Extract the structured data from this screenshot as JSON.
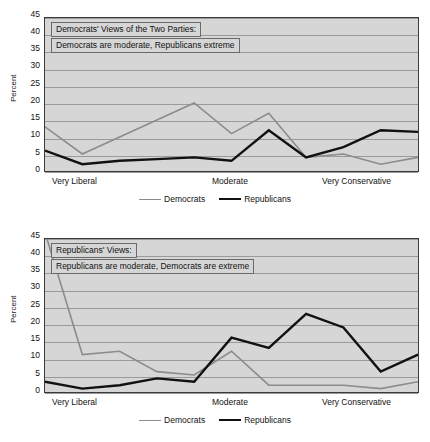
{
  "charts": [
    {
      "id": "democrats-views",
      "title_line_1": "Democrats' Views of the Two Parties:",
      "title_line_2": "Democrats are moderate, Republicans extreme",
      "ylabel": "Percent",
      "yticks": [
        "45",
        "40",
        "35",
        "30",
        "25",
        "20",
        "15",
        "10",
        "5",
        "0"
      ],
      "xticks": [
        "Very Liberal",
        "Moderate",
        "Very Conservative"
      ],
      "legend": [
        "Democrats",
        "Republicans"
      ],
      "chart_data": {
        "type": "line",
        "title": "Democrats' Views of the Two Parties: Democrats are moderate, Republicans extreme",
        "xlabel": "",
        "ylabel": "Percent",
        "ylim": [
          0,
          45
        ],
        "ytick_step": 5,
        "grid": true,
        "legend_position": "bottom",
        "x": [
          "Extremely Liberal",
          "Very Liberal",
          "Liberal",
          "Slightly Liberal",
          "Moderate-Liberal",
          "Moderate",
          "Moderate-Conservative",
          "Slightly Conservative",
          "Conservative",
          "Very Conservative",
          "Extremely Conservative"
        ],
        "categories_labeled": [
          "Very Liberal",
          "Moderate",
          "Very Conservative"
        ],
        "series": [
          {
            "name": "Democrats",
            "color": "#8c8c8c",
            "values": [
              13,
              5,
              10,
              15,
              20,
              11,
              17,
              4,
              5,
              2,
              4
            ]
          },
          {
            "name": "Republicans",
            "color": "#111111",
            "values": [
              6,
              2,
              3,
              3.5,
              4,
              3,
              12,
              4,
              7,
              12,
              11.5
            ]
          }
        ],
        "series_endpoint_note": "Republicans final point rises to 34.5"
      }
    },
    {
      "id": "republicans-views",
      "title_line_1": "Republicans' Views:",
      "title_line_2": "Republicans are moderate, Democrats are extreme",
      "ylabel": "Percent",
      "yticks": [
        "45",
        "40",
        "35",
        "30",
        "25",
        "20",
        "15",
        "10",
        "5",
        "0"
      ],
      "xticks": [
        "Very Liberal",
        "Moderate",
        "Very Conservative"
      ],
      "legend": [
        "Democrats",
        "Republicans"
      ],
      "chart_data": {
        "type": "line",
        "title": "Republicans' Views: Republicans are moderate, Democrats are extreme",
        "xlabel": "",
        "ylabel": "Percent",
        "ylim": [
          0,
          45
        ],
        "ytick_step": 5,
        "grid": true,
        "legend_position": "bottom",
        "x": [
          "Extremely Liberal",
          "Very Liberal",
          "Liberal",
          "Slightly Liberal",
          "Moderate-Liberal",
          "Moderate",
          "Moderate-Conservative",
          "Slightly Conservative",
          "Conservative",
          "Very Conservative",
          "Extremely Conservative"
        ],
        "categories_labeled": [
          "Very Liberal",
          "Moderate",
          "Very Conservative"
        ],
        "series": [
          {
            "name": "Democrats",
            "color": "#8c8c8c",
            "values": [
              47,
              11,
              12,
              6,
              5,
              12,
              2,
              2,
              2,
              1,
              3
            ]
          },
          {
            "name": "Republicans",
            "color": "#111111",
            "values": [
              3,
              1,
              2,
              4,
              3,
              16,
              13,
              23,
              19,
              6,
              11
            ]
          }
        ],
        "series_clip_note": "Democrats first point is clipped above the 45 axis maximum"
      }
    }
  ]
}
